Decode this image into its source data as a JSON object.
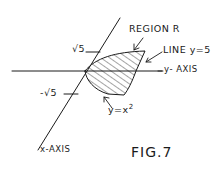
{
  "figure": {
    "caption": "FIG.7",
    "labels": {
      "region": "REGION R",
      "line": "LINE y=5",
      "y_axis": "y- AXIS",
      "x_axis": "x-AXIS",
      "curve": "y=x",
      "curve_exp": "2",
      "tick_pos": "√5",
      "tick_neg": "-√5"
    },
    "colors": {
      "ink": "#1a1a1a",
      "background": "#ffffff"
    },
    "hatching": "diagonal lines"
  }
}
